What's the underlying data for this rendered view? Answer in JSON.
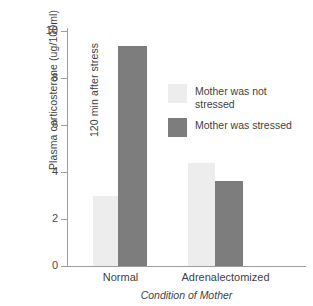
{
  "chart_data": {
    "type": "bar",
    "title": "",
    "xlabel": "Condition of Mother",
    "ylabel": "Plasma corticosterone (ug/100ml) 120 min after stress",
    "ylabel_line1": "Plasma corticosterone (ug/100ml)",
    "ylabel_line2": "120 min after stress",
    "categories": [
      "Normal",
      "Adrenalectomized"
    ],
    "series": [
      {
        "name": "Mother was not stressed",
        "values": [
          3.0,
          4.4
        ],
        "color": "#ededed"
      },
      {
        "name": "Mother was stressed",
        "values": [
          9.35,
          3.6
        ],
        "color": "#7d7d7d"
      }
    ],
    "ylim": [
      0,
      10
    ],
    "yticks": [
      0,
      2,
      4,
      6,
      8,
      10
    ],
    "ytick_labels": [
      "0",
      "2",
      "4",
      "6",
      "8",
      "10"
    ],
    "grid": false,
    "legend_position": "center-right",
    "axis_color": "#9d9d9d",
    "text_color": "#3f3f3f"
  },
  "legend": {
    "entries": [
      {
        "label_line1": "Mother was not",
        "label_line2": "stressed",
        "full": "Mother was not stressed"
      },
      {
        "label_line1": "Mother was stressed",
        "label_line2": "",
        "full": "Mother was stressed"
      }
    ]
  },
  "axes": {
    "y_title_line1": "Plasma corticosterone (ug/100ml)",
    "y_title_line2": "120 min after stress",
    "x_title": "Condition of Mother",
    "tick_0": "0",
    "tick_2": "2",
    "tick_4": "4",
    "tick_6": "6",
    "tick_8": "8",
    "tick_10": "10"
  },
  "groups": {
    "g0": "Normal",
    "g1": "Adrenalectomized"
  }
}
